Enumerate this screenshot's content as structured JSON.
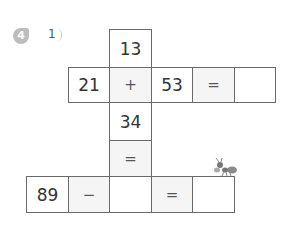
{
  "problem": {
    "number": "4",
    "sub_label": "1",
    "colors": {
      "badge": "#bdbdbd",
      "grid_border": "#6a6a6a",
      "operator_fill": "#f5f5f5"
    }
  },
  "grid": {
    "vertical": {
      "top": "13",
      "op": "+",
      "bottom": "34",
      "eq": "=",
      "result": ""
    },
    "horizontal": {
      "left": "21",
      "op": "+",
      "right": "53",
      "eq": "=",
      "result": ""
    },
    "bottom_row": {
      "left": "89",
      "op": "−",
      "blank": "",
      "eq": "=",
      "result": ""
    }
  },
  "decoration": {
    "icon": "ant-icon"
  }
}
